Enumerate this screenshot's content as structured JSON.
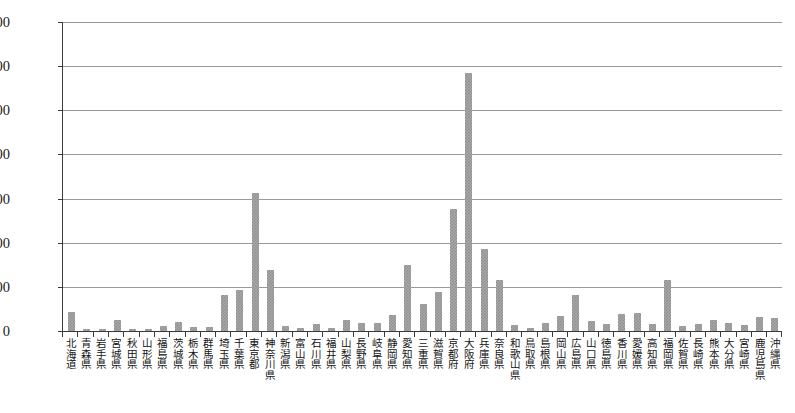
{
  "chart_data": {
    "type": "bar",
    "title": "",
    "subtitle": "",
    "xlabel": "",
    "ylabel": "",
    "ylim": [
      0,
      35000
    ],
    "yticks": [
      "0",
      "5,000",
      "10,000",
      "15,000",
      "20,000",
      "25,000",
      "30,000",
      "35,000"
    ],
    "ytick_values": [
      0,
      5000,
      10000,
      15000,
      20000,
      25000,
      30000,
      35000
    ],
    "grid": true,
    "legend": false,
    "bar_color": "#a8a8a8",
    "bar_pattern": "checkered-gray",
    "axis_color": "#3a3a3a",
    "gridline_color": "#9a9a9a",
    "categories": [
      "北海道",
      "青森県",
      "岩手県",
      "宮城県",
      "秋田県",
      "山形県",
      "福島県",
      "茨城県",
      "栃木県",
      "群馬県",
      "埼玉県",
      "千葉県",
      "東京都",
      "神奈川県",
      "新潟県",
      "富山県",
      "石川県",
      "福井県",
      "山梨県",
      "長野県",
      "岐阜県",
      "静岡県",
      "愛知県",
      "三重県",
      "滋賀県",
      "京都府",
      "大阪府",
      "兵庫県",
      "奈良県",
      "和歌山県",
      "鳥取県",
      "島根県",
      "岡山県",
      "広島県",
      "山口県",
      "徳島県",
      "香川県",
      "愛媛県",
      "高知県",
      "福岡県",
      "佐賀県",
      "長崎県",
      "熊本県",
      "大分県",
      "宮崎県",
      "鹿児島県",
      "沖縄県"
    ],
    "values": [
      2100,
      250,
      200,
      1300,
      180,
      200,
      550,
      1000,
      500,
      450,
      4100,
      4600,
      15600,
      6900,
      550,
      350,
      800,
      350,
      1200,
      900,
      900,
      1800,
      7500,
      3100,
      4400,
      13800,
      29200,
      9300,
      5800,
      700,
      300,
      900,
      1700,
      4100,
      1100,
      800,
      1900,
      2000,
      750,
      5800,
      600,
      800,
      1200,
      900,
      700,
      1600,
      1500
    ]
  }
}
